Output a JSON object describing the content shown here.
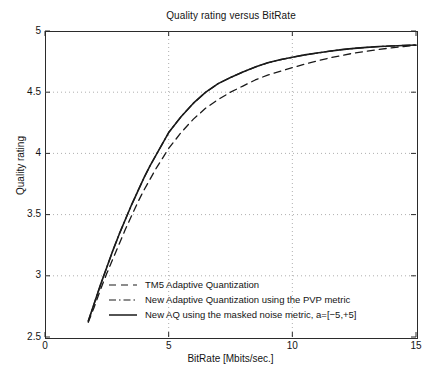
{
  "chart_data": {
    "type": "line",
    "title": "Quality rating versus BitRate",
    "xlabel": "BitRate [Mbits/sec.]",
    "ylabel": "Quality rating",
    "xlim": [
      0,
      15
    ],
    "ylim": [
      2.5,
      5
    ],
    "xticks": [
      "0",
      "5",
      "10",
      "15"
    ],
    "xtick_values": [
      0,
      5,
      10,
      15
    ],
    "yticks": [
      "2.5",
      "3",
      "3.5",
      "4",
      "4.5",
      "5"
    ],
    "ytick_values": [
      2.5,
      3,
      3.5,
      4,
      4.5,
      5
    ],
    "grid": true,
    "grid_style": "dotted",
    "legend_position": "lower-center-inside",
    "series": [
      {
        "name": "TM5 Adaptive Quantization",
        "style": "dashed",
        "color": "#1a1a1a",
        "x": [
          1.75,
          2.0,
          2.25,
          2.5,
          2.75,
          3.0,
          3.25,
          3.5,
          3.75,
          4.0,
          4.25,
          4.5,
          4.75,
          5.0,
          5.5,
          6.0,
          6.5,
          7.0,
          7.5,
          8.0,
          8.5,
          9.0,
          9.5,
          10.0,
          10.5,
          11.0,
          11.5,
          12.0,
          12.5,
          13.0,
          13.5,
          14.0,
          14.5,
          15.0
        ],
        "y": [
          2.62,
          2.75,
          2.89,
          3.02,
          3.14,
          3.26,
          3.38,
          3.49,
          3.6,
          3.7,
          3.79,
          3.88,
          3.96,
          4.04,
          4.17,
          4.28,
          4.37,
          4.44,
          4.5,
          4.55,
          4.6,
          4.64,
          4.67,
          4.7,
          4.73,
          4.755,
          4.78,
          4.8,
          4.82,
          4.835,
          4.85,
          4.862,
          4.873,
          4.883
        ]
      },
      {
        "name": "New Adaptive Quantization using the PVP metric",
        "style": "dash-dot",
        "color": "#1a1a1a",
        "x": [
          1.75,
          2.0,
          2.25,
          2.5,
          2.75,
          3.0,
          3.25,
          3.5,
          3.75,
          4.0,
          4.25,
          4.5,
          4.75,
          5.0,
          5.5,
          6.0,
          6.5,
          7.0,
          7.5,
          8.0,
          8.5,
          9.0,
          9.5,
          10.0,
          10.5,
          11.0,
          11.5,
          12.0,
          12.5,
          13.0,
          13.5,
          14.0,
          14.5,
          15.0
        ],
        "y": [
          2.63,
          2.78,
          2.93,
          3.07,
          3.21,
          3.34,
          3.46,
          3.58,
          3.69,
          3.8,
          3.9,
          3.99,
          4.08,
          4.17,
          4.3,
          4.41,
          4.5,
          4.57,
          4.62,
          4.665,
          4.705,
          4.74,
          4.765,
          4.785,
          4.805,
          4.82,
          4.835,
          4.848,
          4.858,
          4.866,
          4.873,
          4.878,
          4.882,
          4.886
        ]
      },
      {
        "name": "New AQ using the masked noise metric, a=[-5,+5]",
        "style": "solid",
        "color": "#1a1a1a",
        "x": [
          1.75,
          2.0,
          2.25,
          2.5,
          2.75,
          3.0,
          3.25,
          3.5,
          3.75,
          4.0,
          4.25,
          4.5,
          4.75,
          5.0,
          5.5,
          6.0,
          6.5,
          7.0,
          7.5,
          8.0,
          8.5,
          9.0,
          9.5,
          10.0,
          10.5,
          11.0,
          11.5,
          12.0,
          12.5,
          13.0,
          13.5,
          14.0,
          14.5,
          15.0
        ],
        "y": [
          2.63,
          2.78,
          2.93,
          3.07,
          3.21,
          3.34,
          3.46,
          3.58,
          3.69,
          3.8,
          3.9,
          3.99,
          4.08,
          4.17,
          4.3,
          4.41,
          4.5,
          4.57,
          4.62,
          4.665,
          4.705,
          4.74,
          4.765,
          4.785,
          4.805,
          4.82,
          4.835,
          4.848,
          4.858,
          4.866,
          4.873,
          4.878,
          4.882,
          4.886
        ]
      }
    ]
  },
  "legend": {
    "items": [
      {
        "label": "TM5 Adaptive Quantization",
        "style": "dashed"
      },
      {
        "label": "New Adaptive Quantization using the PVP metric",
        "style": "dash-dot"
      },
      {
        "label": "New AQ using the masked noise metric, a=[−5,+5]",
        "style": "solid"
      }
    ]
  }
}
